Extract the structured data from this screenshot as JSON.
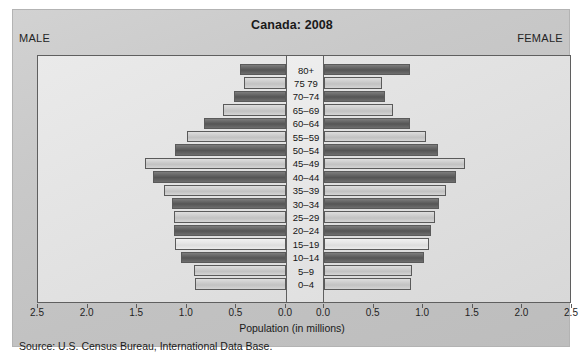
{
  "figure": {
    "title": "Canada: 2008",
    "male_label": "MALE",
    "female_label": "FEMALE",
    "axis_title": "Population (in millions)",
    "source": "Source: U.S. Census Bureau, International Data Base."
  },
  "chart_data": {
    "type": "bar",
    "subtype": "population-pyramid",
    "title": "Canada: 2008",
    "xlabel": "Population (in millions)",
    "ylabel": "",
    "orientation": "horizontal",
    "grid": false,
    "legend_position": "none",
    "axis_max": 2.5,
    "left_axis_ticks": [
      "2.5",
      "2.0",
      "1.5",
      "1.0",
      "0.5",
      "0.0"
    ],
    "right_axis_ticks": [
      "0.0",
      "0.5",
      "1.0",
      "1.5",
      "2.0",
      "2.5"
    ],
    "left_series_name": "MALE",
    "right_series_name": "FEMALE",
    "categories": [
      "80+",
      "75  79",
      "70–74",
      "65–69",
      "60–64",
      "55–59",
      "50–54",
      "45–49",
      "40–44",
      "35–39",
      "30–34",
      "25–29",
      "20–24",
      "15–19",
      "10–14",
      "5–9",
      "0–4"
    ],
    "series": [
      {
        "name": "MALE",
        "values": [
          0.46,
          0.42,
          0.52,
          0.64,
          0.83,
          1.0,
          1.12,
          1.42,
          1.34,
          1.23,
          1.15,
          1.13,
          1.13,
          1.12,
          1.06,
          0.93,
          0.92
        ]
      },
      {
        "name": "FEMALE",
        "values": [
          0.87,
          0.58,
          0.61,
          0.7,
          0.87,
          1.03,
          1.15,
          1.42,
          1.33,
          1.23,
          1.16,
          1.12,
          1.08,
          1.06,
          1.01,
          0.89,
          0.88
        ]
      }
    ],
    "shading": [
      "dark",
      "light",
      "dark",
      "light",
      "dark",
      "light",
      "dark",
      "light",
      "dark",
      "light",
      "dark",
      "light",
      "dark",
      "vlight",
      "dark",
      "light",
      "light"
    ]
  }
}
